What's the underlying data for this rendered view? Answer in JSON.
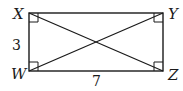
{
  "figure": {
    "type": "rectangle-with-diagonals",
    "vertices": {
      "X": {
        "label": "X",
        "x": 29,
        "y": 13
      },
      "Y": {
        "label": "Y",
        "x": 163,
        "y": 13
      },
      "Z": {
        "label": "Z",
        "x": 163,
        "y": 71
      },
      "W": {
        "label": "W",
        "x": 29,
        "y": 71
      }
    },
    "sides": {
      "XW": {
        "label": "3"
      },
      "WZ": {
        "label": "7"
      }
    },
    "diagonals": [
      "XZ",
      "YW"
    ],
    "right_angle_marks": [
      "X",
      "Y",
      "Z",
      "W"
    ],
    "stroke_color": "#1a1a1a"
  }
}
